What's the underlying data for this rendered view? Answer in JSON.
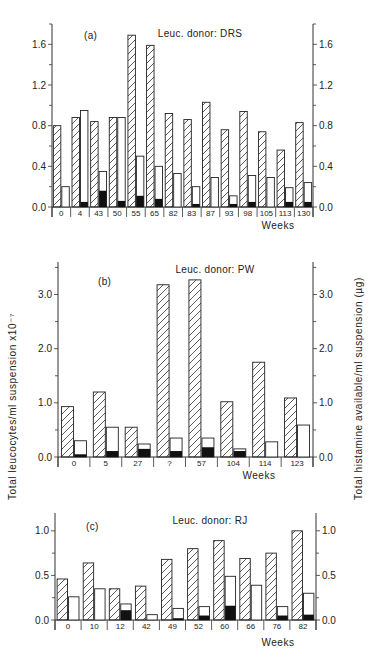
{
  "figure": {
    "left_axis_title": "Total leucocytes/ml suspension x10⁻⁷",
    "right_axis_title": "Total histamine available/ml suspension (µg)",
    "legend_encoding": {
      "hatched": "Total leucocytes/ml suspension x10^-7",
      "white": "Total histamine available/ml suspension (µg)",
      "black": "Histamine released (µg)"
    }
  },
  "chart_data": [
    {
      "type": "bar",
      "panel": "(a)",
      "title": "Leuc. donor: DRS",
      "xlabel": "Weeks",
      "ylabel": "Total leucocytes/ml suspension x10^-7",
      "ylabel_right": "Total histamine available/ml suspension (µg)",
      "ylim": [
        0,
        1.8
      ],
      "yticks": [
        "0.0",
        "0.4",
        "0.8",
        "1.2",
        "1.6"
      ],
      "grid": false,
      "categories": [
        "0",
        "4",
        "43",
        "50",
        "55",
        "65",
        "82",
        "83",
        "87",
        "93",
        "98",
        "105",
        "113",
        "130"
      ],
      "series": [
        {
          "name": "Leucocytes (hatched)",
          "values": [
            0.8,
            0.88,
            0.84,
            0.88,
            1.69,
            1.59,
            0.92,
            0.86,
            1.03,
            0.76,
            0.94,
            0.74,
            0.56,
            0.83
          ]
        },
        {
          "name": "Histamine available (white)",
          "values": [
            0.2,
            0.95,
            0.35,
            0.88,
            0.5,
            0.4,
            0.33,
            0.2,
            0.29,
            0.11,
            0.31,
            0.29,
            0.19,
            0.24
          ]
        },
        {
          "name": "Histamine released (black)",
          "values": [
            0.0,
            0.05,
            0.16,
            0.06,
            0.11,
            0.08,
            0.0,
            0.03,
            0.0,
            0.03,
            0.05,
            0.0,
            0.05,
            0.05
          ]
        }
      ]
    },
    {
      "type": "bar",
      "panel": "(b)",
      "title": "Leuc. donor: PW",
      "xlabel": "Weeks",
      "ylabel": "Total leucocytes/ml suspension x10^-7",
      "ylabel_right": "Total histamine available/ml suspension (µg)",
      "ylim": [
        0,
        3.6
      ],
      "yticks": [
        "0.0",
        "1.0",
        "2.0",
        "3.0"
      ],
      "grid": false,
      "categories": [
        "0",
        "5",
        "27",
        "?",
        "57",
        "104",
        "114",
        "123"
      ],
      "series": [
        {
          "name": "Leucocytes (hatched)",
          "values": [
            0.93,
            1.2,
            0.55,
            3.18,
            3.27,
            1.02,
            1.75,
            1.09
          ]
        },
        {
          "name": "Histamine available (white)",
          "values": [
            0.3,
            0.55,
            0.24,
            0.35,
            0.35,
            0.15,
            0.28,
            0.59
          ]
        },
        {
          "name": "Histamine released (black)",
          "values": [
            0.05,
            0.11,
            0.15,
            0.11,
            0.18,
            0.11,
            0.0,
            0.0
          ]
        }
      ]
    },
    {
      "type": "bar",
      "panel": "(c)",
      "title": "Leuc. donor: RJ",
      "xlabel": "Weeks",
      "ylabel": "Total leucocytes/ml suspension x10^-7",
      "ylabel_right": "Total histamine available/ml suspension (µg)",
      "ylim": [
        0,
        1.2
      ],
      "yticks": [
        "0.0",
        "0.5",
        "1.0"
      ],
      "grid": false,
      "categories": [
        "0",
        "10",
        "12",
        "42",
        "49",
        "52",
        "60",
        "66",
        "76",
        "82"
      ],
      "series": [
        {
          "name": "Leucocytes (hatched)",
          "values": [
            0.46,
            0.64,
            0.35,
            0.38,
            0.68,
            0.8,
            0.89,
            0.69,
            0.75,
            1.0
          ]
        },
        {
          "name": "Histamine available (white)",
          "values": [
            0.26,
            0.35,
            0.18,
            0.06,
            0.13,
            0.15,
            0.49,
            0.39,
            0.15,
            0.3
          ]
        },
        {
          "name": "Histamine released (black)",
          "values": [
            0.0,
            0.0,
            0.11,
            0.0,
            0.02,
            0.05,
            0.16,
            0.0,
            0.05,
            0.06
          ]
        }
      ]
    }
  ],
  "layout": [
    {
      "x0": 52,
      "x1": 313,
      "y0": 207,
      "ytop": 24,
      "ymax": 1.8,
      "title_x": 200,
      "title_y": 37,
      "label_x": 84,
      "label_y": 39,
      "weeks_x": 278,
      "weeks_y": 229,
      "tick_vals": [
        0,
        0.4,
        0.8,
        1.2,
        1.6
      ],
      "minor": 0.2
    },
    {
      "x0": 58,
      "x1": 313,
      "y0": 457,
      "ytop": 262,
      "ymax": 3.6,
      "title_x": 215,
      "title_y": 273,
      "label_x": 98,
      "label_y": 285,
      "weeks_x": 259,
      "weeks_y": 479,
      "tick_vals": [
        0,
        1,
        2,
        3
      ],
      "minor": 0.5
    },
    {
      "x0": 55,
      "x1": 316,
      "y0": 620,
      "ytop": 513,
      "ymax": 1.2,
      "title_x": 210,
      "title_y": 524,
      "label_x": 86,
      "label_y": 530,
      "weeks_x": 278,
      "weeks_y": 646,
      "tick_vals": [
        0,
        0.5,
        1.0
      ],
      "minor": 0.25
    }
  ]
}
